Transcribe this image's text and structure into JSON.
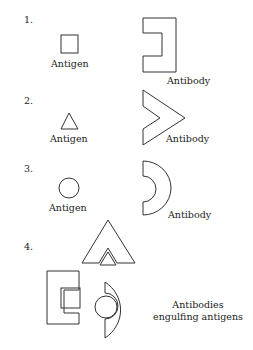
{
  "diagram": {
    "stroke_color": "#333333",
    "panels": [
      {
        "number": "1.",
        "antigen_label": "Antigen",
        "antibody_label": "Antibody",
        "antigen_shape": "square",
        "antibody_shape": "square-notch"
      },
      {
        "number": "2.",
        "antigen_label": "Antigen",
        "antibody_label": "Antibody",
        "antigen_shape": "triangle",
        "antibody_shape": "chevron-notch"
      },
      {
        "number": "3.",
        "antigen_label": "Antigen",
        "antibody_label": "Antibody",
        "antigen_shape": "circle",
        "antibody_shape": "half-disc-notch"
      },
      {
        "number": "4.",
        "caption_line1": "Antibodies",
        "caption_line2": "engulfing antigens"
      }
    ]
  }
}
